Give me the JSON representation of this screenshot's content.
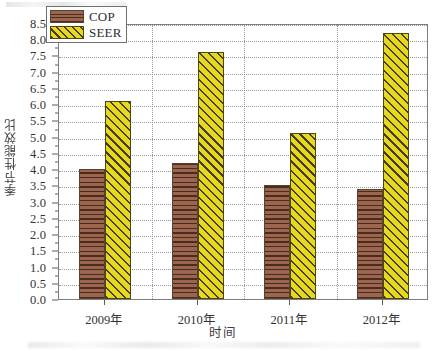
{
  "chart_data": {
    "type": "bar",
    "title": "",
    "xlabel": "时间",
    "ylabel": "季节性能效比",
    "categories": [
      "2009年",
      "2010年",
      "2011年",
      "2012年"
    ],
    "series": [
      {
        "name": "COP",
        "values": [
          4.0,
          4.2,
          3.5,
          3.4
        ],
        "color": "#9c6550",
        "pattern": "horizontal-lines"
      },
      {
        "name": "SEER",
        "values": [
          6.1,
          7.6,
          5.1,
          8.2
        ],
        "color": "#e6d81e",
        "pattern": "diagonal-hatch"
      }
    ],
    "ylim": [
      0.0,
      8.5
    ],
    "ytick_step": 0.5,
    "yticks": [
      "0.0",
      "0.5",
      "1.0",
      "1.5",
      "2.0",
      "2.5",
      "3.0",
      "3.5",
      "4.0",
      "4.5",
      "5.0",
      "5.5",
      "6.0",
      "6.5",
      "7.0",
      "7.5",
      "8.0",
      "8.5"
    ],
    "grid": "dotted-both",
    "legend_position": "top-left-inside"
  },
  "legend": {
    "entries": [
      {
        "label": "COP"
      },
      {
        "label": "SEER"
      }
    ]
  },
  "axes": {
    "y_title": "季节性能效比",
    "x_title": "时间"
  }
}
